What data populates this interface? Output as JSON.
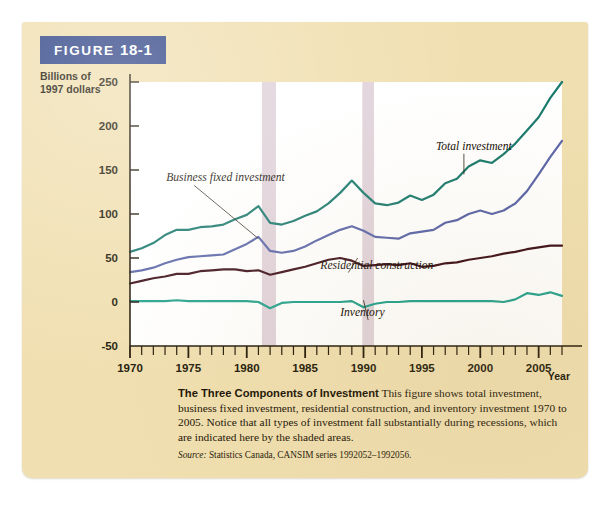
{
  "figure": {
    "tag_prefix": "FIGURE",
    "tag_number": "18-1",
    "caption_title": "The Three Components of Investment",
    "caption_body": " This figure shows total investment, business fixed investment, residential construction, and inventory investment 1970 to 2005. Notice that all types of investment fall substantially during recessions, which are indicated here by the shaded areas.",
    "source_prefix": "Source:",
    "source_text": " Statistics Canada, CANSIM series 1992052–1992056."
  },
  "colors": {
    "panel_background": "#f0dfb0",
    "tag_background": "#2f4486",
    "plot_background": "#ffffff",
    "recession_shade": "#e0d2da",
    "total_investment": "#1b7a6e",
    "business_fixed_investment": "#5b66a8",
    "residential_construction": "#3d0f18",
    "inventory": "#23a18c",
    "axis": "#231a0a"
  },
  "chart_data": {
    "type": "line",
    "title": "The Three Components of Investment",
    "xlabel": "Year",
    "ylabel": "Billions of 1997 dollars",
    "ylabel_line1": "Billions of",
    "ylabel_line2": "1997 dollars",
    "xlim": [
      1970,
      2007
    ],
    "ylim": [
      -50,
      250
    ],
    "ytick_labels": [
      "250",
      "200",
      "150",
      "100",
      "50",
      "0",
      "-50"
    ],
    "yticks": [
      250,
      200,
      150,
      100,
      50,
      0,
      -50
    ],
    "xtick_labels": [
      "1970",
      "1975",
      "1980",
      "1985",
      "1990",
      "1995",
      "2000",
      "2005"
    ],
    "xticks_major": [
      1970,
      1975,
      1980,
      1985,
      1990,
      1995,
      2000,
      2005
    ],
    "xticks_minor_step": 1,
    "grid": false,
    "legend_position": "inline-annotations",
    "annotations": [
      {
        "label": "Business fixed investment",
        "x": 1973.1,
        "y": 137,
        "point_x": 1981.0,
        "point_y": 72
      },
      {
        "label": "Total investment",
        "x": 1996.2,
        "y": 173,
        "point_x": 1998.6,
        "point_y": 145
      },
      {
        "label": "Residential construction",
        "x": 1986.3,
        "y": 38,
        "point_x": 1989.5,
        "point_y": 50
      },
      {
        "label": "Inventory",
        "x": 1988.0,
        "y": -16,
        "point_x": 1990.0,
        "point_y": 2
      }
    ],
    "recessions": [
      {
        "label": "recession-1981-1982",
        "start": 1981.3,
        "end": 1982.5
      },
      {
        "label": "recession-1990-1991",
        "start": 1989.9,
        "end": 1990.9
      }
    ],
    "x": [
      1970,
      1971,
      1972,
      1973,
      1974,
      1975,
      1976,
      1977,
      1978,
      1979,
      1980,
      1981,
      1982,
      1983,
      1984,
      1985,
      1986,
      1987,
      1988,
      1989,
      1990,
      1991,
      1992,
      1993,
      1994,
      1995,
      1996,
      1997,
      1998,
      1999,
      2000,
      2001,
      2002,
      2003,
      2004,
      2005,
      2006,
      2007
    ],
    "series": [
      {
        "name": "Total investment",
        "color": "#1b7a6e",
        "values": [
          57,
          61,
          67,
          76,
          82,
          82,
          85,
          86,
          88,
          94,
          99,
          109,
          90,
          88,
          92,
          98,
          103,
          112,
          124,
          138,
          124,
          112,
          110,
          113,
          121,
          116,
          122,
          135,
          140,
          154,
          161,
          158,
          168,
          180,
          195,
          210,
          232,
          250
        ]
      },
      {
        "name": "Business fixed investment",
        "color": "#5b66a8",
        "values": [
          34,
          36,
          39,
          44,
          48,
          51,
          52,
          53,
          54,
          60,
          66,
          74,
          58,
          56,
          58,
          63,
          70,
          76,
          82,
          86,
          81,
          74,
          73,
          72,
          78,
          80,
          82,
          90,
          93,
          100,
          104,
          100,
          104,
          112,
          126,
          145,
          165,
          183
        ]
      },
      {
        "name": "Residential construction",
        "color": "#3d0f18",
        "values": [
          21,
          24,
          27,
          29,
          32,
          32,
          35,
          36,
          37,
          37,
          35,
          36,
          31,
          34,
          37,
          40,
          44,
          48,
          50,
          47,
          41,
          42,
          43,
          42,
          44,
          40,
          41,
          44,
          45,
          48,
          50,
          52,
          55,
          57,
          60,
          62,
          64,
          64
        ]
      },
      {
        "name": "Inventory",
        "color": "#23a18c",
        "values": [
          1,
          1,
          1,
          1,
          2,
          1,
          1,
          1,
          1,
          1,
          1,
          0,
          -7,
          -1,
          0,
          0,
          0,
          0,
          0,
          1,
          -6,
          -2,
          0,
          0,
          1,
          1,
          1,
          1,
          1,
          1,
          1,
          1,
          0,
          3,
          10,
          8,
          11,
          7
        ]
      }
    ]
  }
}
